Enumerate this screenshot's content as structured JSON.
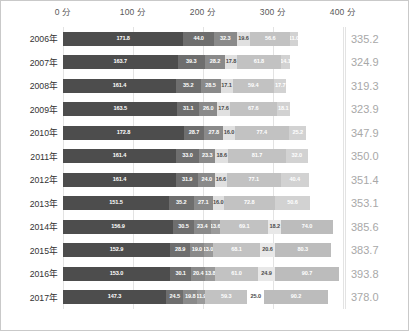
{
  "chart_data": {
    "type": "bar",
    "orientation": "horizontal",
    "stacked": true,
    "title": "",
    "xlabel": "",
    "ylabel": "",
    "xlim": [
      0,
      400
    ],
    "grid": true,
    "legend_position": "none",
    "axis_unit": "分",
    "xticks": [
      {
        "value": 0,
        "label": "0 分"
      },
      {
        "value": 100,
        "label": "100 分"
      },
      {
        "value": 200,
        "label": "200 分"
      },
      {
        "value": 300,
        "label": "300 分"
      },
      {
        "value": 400,
        "label": "400 分"
      }
    ],
    "categories": [
      "2006年",
      "2007年",
      "2008年",
      "2009年",
      "2010年",
      "2011年",
      "2012年",
      "2013年",
      "2014年",
      "2015年",
      "2016年",
      "2017年"
    ],
    "series": [
      {
        "name": "seg1",
        "color": "#4d4d4d",
        "values": [
          171.8,
          163.7,
          161.4,
          163.5,
          172.8,
          161.4,
          161.4,
          151.5,
          156.9,
          152.9,
          153.0,
          147.3
        ]
      },
      {
        "name": "seg2",
        "color": "#6e6e6e",
        "values": [
          44.0,
          39.3,
          35.2,
          31.1,
          28.7,
          33.0,
          31.9,
          35.2,
          30.5,
          28.9,
          30.1,
          24.5
        ]
      },
      {
        "name": "seg3",
        "color": "#8a8a8a",
        "values": [
          32.3,
          28.2,
          28.5,
          26.0,
          27.8,
          23.3,
          24.0,
          27.1,
          23.4,
          19.0,
          20.4,
          19.8
        ]
      },
      {
        "name": "seg4",
        "color": "#d9d9d9",
        "values": [
          19.6,
          17.8,
          17.1,
          17.6,
          16.0,
          18.6,
          16.6,
          16.0,
          13.6,
          13.0,
          13.8,
          11.9
        ]
      },
      {
        "name": "seg5",
        "color": "#b5b5b5",
        "values": [
          56.6,
          61.8,
          59.4,
          67.6,
          77.4,
          81.7,
          77.1,
          72.8,
          69.1,
          68.1,
          61.0,
          59.3
        ]
      },
      {
        "name": "seg6",
        "color": "#cfcfcf",
        "values": [
          11.0,
          14.1,
          17.7,
          18.1,
          25.2,
          32.0,
          40.4,
          50.6,
          18.2,
          20.6,
          24.9,
          25.0
        ]
      },
      {
        "name": "seg7",
        "color": "#b0b0b0",
        "values": [
          0,
          0,
          0,
          0,
          0,
          0,
          0,
          0,
          74.0,
          80.3,
          90.7,
          90.2
        ]
      }
    ],
    "row_labels": [
      {
        "year": "2006年",
        "total": "335.2",
        "segments": [
          {
            "value": 171.8,
            "label": "171.8",
            "color": "#4d4d4d"
          },
          {
            "value": 44.0,
            "label": "44.0",
            "color": "#6e6e6e"
          },
          {
            "value": 32.3,
            "label": "32.3",
            "color": "#8a8a8a"
          },
          {
            "value": 19.6,
            "label": "19.6",
            "color": "#e0e0e0",
            "dark_text": true
          },
          {
            "value": 56.6,
            "label": "56.6",
            "color": "#c2c2c2"
          },
          {
            "value": 11.0,
            "label": "11.0",
            "color": "#d2d2d2"
          }
        ]
      },
      {
        "year": "2007年",
        "total": "324.9",
        "segments": [
          {
            "value": 163.7,
            "label": "163.7",
            "color": "#4d4d4d"
          },
          {
            "value": 39.3,
            "label": "39.3",
            "color": "#6e6e6e"
          },
          {
            "value": 28.2,
            "label": "28.2",
            "color": "#8a8a8a"
          },
          {
            "value": 17.8,
            "label": "17.8",
            "color": "#e0e0e0",
            "dark_text": true
          },
          {
            "value": 61.8,
            "label": "61.8",
            "color": "#c2c2c2"
          },
          {
            "value": 14.1,
            "label": "14.1",
            "color": "#d2d2d2"
          }
        ]
      },
      {
        "year": "2008年",
        "total": "319.3",
        "segments": [
          {
            "value": 161.4,
            "label": "161.4",
            "color": "#4d4d4d"
          },
          {
            "value": 35.2,
            "label": "35.2",
            "color": "#6e6e6e"
          },
          {
            "value": 28.5,
            "label": "28.5",
            "color": "#8a8a8a"
          },
          {
            "value": 17.1,
            "label": "17.1",
            "color": "#e0e0e0",
            "dark_text": true
          },
          {
            "value": 59.4,
            "label": "59.4",
            "color": "#c2c2c2"
          },
          {
            "value": 17.7,
            "label": "17.7",
            "color": "#d2d2d2"
          }
        ]
      },
      {
        "year": "2009年",
        "total": "323.9",
        "segments": [
          {
            "value": 163.5,
            "label": "163.5",
            "color": "#4d4d4d"
          },
          {
            "value": 31.1,
            "label": "31.1",
            "color": "#6e6e6e"
          },
          {
            "value": 26.0,
            "label": "26.0",
            "color": "#8a8a8a"
          },
          {
            "value": 17.6,
            "label": "17.6",
            "color": "#e0e0e0",
            "dark_text": true
          },
          {
            "value": 67.6,
            "label": "67.6",
            "color": "#c2c2c2"
          },
          {
            "value": 18.1,
            "label": "18.1",
            "color": "#d2d2d2"
          }
        ]
      },
      {
        "year": "2010年",
        "total": "347.9",
        "segments": [
          {
            "value": 172.8,
            "label": "172.8",
            "color": "#4d4d4d"
          },
          {
            "value": 28.7,
            "label": "28.7",
            "color": "#6e6e6e"
          },
          {
            "value": 27.8,
            "label": "27.8",
            "color": "#8a8a8a"
          },
          {
            "value": 16.0,
            "label": "16.0",
            "color": "#e0e0e0",
            "dark_text": true
          },
          {
            "value": 77.4,
            "label": "77.4",
            "color": "#c2c2c2"
          },
          {
            "value": 25.2,
            "label": "25.2",
            "color": "#d2d2d2"
          }
        ]
      },
      {
        "year": "2011年",
        "total": "350.0",
        "segments": [
          {
            "value": 161.4,
            "label": "161.4",
            "color": "#4d4d4d"
          },
          {
            "value": 33.0,
            "label": "33.0",
            "color": "#6e6e6e"
          },
          {
            "value": 23.3,
            "label": "23.3",
            "color": "#8a8a8a"
          },
          {
            "value": 18.6,
            "label": "18.6",
            "color": "#e0e0e0",
            "dark_text": true
          },
          {
            "value": 81.7,
            "label": "81.7",
            "color": "#c2c2c2"
          },
          {
            "value": 32.0,
            "label": "32.0",
            "color": "#d2d2d2"
          }
        ]
      },
      {
        "year": "2012年",
        "total": "351.4",
        "segments": [
          {
            "value": 161.4,
            "label": "161.4",
            "color": "#4d4d4d"
          },
          {
            "value": 31.9,
            "label": "31.9",
            "color": "#6e6e6e"
          },
          {
            "value": 24.0,
            "label": "24.0",
            "color": "#8a8a8a"
          },
          {
            "value": 16.6,
            "label": "16.6",
            "color": "#e0e0e0",
            "dark_text": true
          },
          {
            "value": 77.1,
            "label": "77.1",
            "color": "#c2c2c2"
          },
          {
            "value": 40.4,
            "label": "40.4",
            "color": "#d2d2d2"
          }
        ]
      },
      {
        "year": "2013年",
        "total": "353.1",
        "segments": [
          {
            "value": 151.5,
            "label": "151.5",
            "color": "#4d4d4d"
          },
          {
            "value": 35.2,
            "label": "35.2",
            "color": "#6e6e6e"
          },
          {
            "value": 27.1,
            "label": "27.1",
            "color": "#8a8a8a"
          },
          {
            "value": 16.0,
            "label": "16.0",
            "color": "#e0e0e0",
            "dark_text": true
          },
          {
            "value": 72.8,
            "label": "72.8",
            "color": "#c2c2c2"
          },
          {
            "value": 50.6,
            "label": "50.6",
            "color": "#d2d2d2"
          }
        ]
      },
      {
        "year": "2014年",
        "total": "385.6",
        "segments": [
          {
            "value": 156.9,
            "label": "156.9",
            "color": "#4d4d4d"
          },
          {
            "value": 30.5,
            "label": "30.5",
            "color": "#6e6e6e"
          },
          {
            "value": 23.4,
            "label": "23.4",
            "color": "#8a8a8a"
          },
          {
            "value": 13.6,
            "label": "13.6",
            "color": "#9a9a9a"
          },
          {
            "value": 69.1,
            "label": "69.1",
            "color": "#c2c2c2"
          },
          {
            "value": 18.2,
            "label": "18.2",
            "color": "#e8e8e8",
            "dark_text": true
          },
          {
            "value": 74.0,
            "label": "74.0",
            "color": "#bcbcbc"
          }
        ]
      },
      {
        "year": "2015年",
        "total": "383.7",
        "segments": [
          {
            "value": 152.9,
            "label": "152.9",
            "color": "#4d4d4d"
          },
          {
            "value": 28.9,
            "label": "28.9",
            "color": "#6e6e6e"
          },
          {
            "value": 19.0,
            "label": "19.0",
            "color": "#8a8a8a"
          },
          {
            "value": 13.0,
            "label": "13.0",
            "color": "#9a9a9a"
          },
          {
            "value": 68.1,
            "label": "68.1",
            "color": "#c2c2c2"
          },
          {
            "value": 20.6,
            "label": "20.6",
            "color": "#e8e8e8",
            "dark_text": true
          },
          {
            "value": 80.3,
            "label": "80.3",
            "color": "#bcbcbc"
          }
        ]
      },
      {
        "year": "2016年",
        "total": "393.8",
        "segments": [
          {
            "value": 153.0,
            "label": "153.0",
            "color": "#4d4d4d"
          },
          {
            "value": 30.1,
            "label": "30.1",
            "color": "#6e6e6e"
          },
          {
            "value": 20.4,
            "label": "20.4",
            "color": "#8a8a8a"
          },
          {
            "value": 13.8,
            "label": "13.8",
            "color": "#9a9a9a"
          },
          {
            "value": 61.0,
            "label": "61.0",
            "color": "#c2c2c2"
          },
          {
            "value": 24.9,
            "label": "24.9",
            "color": "#e8e8e8",
            "dark_text": true
          },
          {
            "value": 90.7,
            "label": "90.7",
            "color": "#bcbcbc"
          }
        ]
      },
      {
        "year": "2017年",
        "total": "378.0",
        "segments": [
          {
            "value": 147.3,
            "label": "147.3",
            "color": "#4d4d4d"
          },
          {
            "value": 24.5,
            "label": "24.5",
            "color": "#6e6e6e"
          },
          {
            "value": 19.8,
            "label": "19.8",
            "color": "#8a8a8a"
          },
          {
            "value": 11.9,
            "label": "11.9",
            "color": "#9a9a9a"
          },
          {
            "value": 59.3,
            "label": "59.3",
            "color": "#c2c2c2"
          },
          {
            "value": 25.0,
            "label": "25.0",
            "color": "#ffffff",
            "dark_text": true
          },
          {
            "value": 90.2,
            "label": "90.2",
            "color": "#bcbcbc"
          }
        ]
      }
    ]
  },
  "layout": {
    "px_per_unit": 0.7,
    "plot_left": 62,
    "plot_top": 26,
    "row_height": 23.5,
    "bar_height": 14,
    "border_color": "#c9c9c9",
    "grid_color": "#e3e3e3",
    "total_text_color": "#a8a8a8",
    "year_text_color": "#333333",
    "tick_text_color": "#595959"
  }
}
